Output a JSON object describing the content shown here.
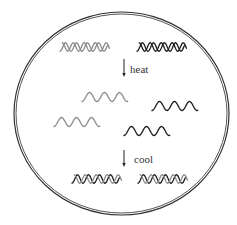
{
  "diagram": {
    "colors": {
      "strand_gray": "#8a8a8a",
      "strand_black": "#1a1a1a",
      "border": "#333333",
      "background": "#ffffff"
    },
    "stages": [
      {
        "id": "initial",
        "description": "two double-stranded DNA helices",
        "count": 2
      },
      {
        "id": "denatured",
        "description": "four single strands (two gray, two black)",
        "count": 4
      },
      {
        "id": "renatured",
        "description": "two double-stranded DNA helices (hybrid)",
        "count": 2
      }
    ],
    "steps": [
      {
        "label": "heat"
      },
      {
        "label": "cool"
      }
    ]
  }
}
